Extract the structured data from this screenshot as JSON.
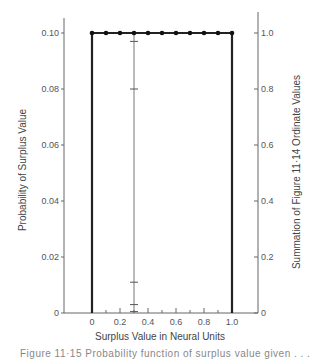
{
  "chart_data": {
    "type": "line",
    "title": "",
    "xlabel": "Surplus Value in Neural Units",
    "ylabel": "Probability of Surplus Value",
    "ylabel_right": "Summation of Figure 11·14 Ordinate Values",
    "xlim": [
      0,
      1.0
    ],
    "ylim": [
      0,
      0.1
    ],
    "ylim_right": [
      0,
      1.0
    ],
    "grid": false,
    "x_ticks": [
      "0",
      "0.2",
      "0.4",
      "0.6",
      "0.8",
      "1.0"
    ],
    "x_tick_values": [
      0,
      0.2,
      0.4,
      0.6,
      0.8,
      1.0
    ],
    "x_minor_ticks": [
      0.1,
      0.3,
      0.5,
      0.7,
      0.9
    ],
    "y_ticks": [
      "0",
      "0.02",
      "0.04",
      "0.06",
      "0.08",
      "0.10"
    ],
    "y_tick_values": [
      0,
      0.02,
      0.04,
      0.06,
      0.08,
      0.1
    ],
    "y_right_ticks": [
      "0",
      "0.2",
      "0.4",
      "0.6",
      "0.8",
      "1.0"
    ],
    "y_right_tick_values": [
      0,
      0.2,
      0.4,
      0.6,
      0.8,
      1.0
    ],
    "series": [
      {
        "name": "Uniform probability",
        "x": [
          0,
          0.1,
          0.2,
          0.3,
          0.4,
          0.5,
          0.6,
          0.7,
          0.8,
          0.9,
          1.0
        ],
        "values": [
          0.1,
          0.1,
          0.1,
          0.1,
          0.1,
          0.1,
          0.1,
          0.1,
          0.1,
          0.1,
          0.1
        ],
        "markers": true
      }
    ],
    "annotations": {
      "vertical_drop_lines_at_x": [
        0,
        1.0
      ],
      "summation_line_x": 0.3,
      "summation_line_tick_values": [
        0.005,
        0.03,
        0.11,
        0.8,
        0.97
      ]
    }
  },
  "caption": "Figure 11·15   Probability function of surplus value given . . ."
}
